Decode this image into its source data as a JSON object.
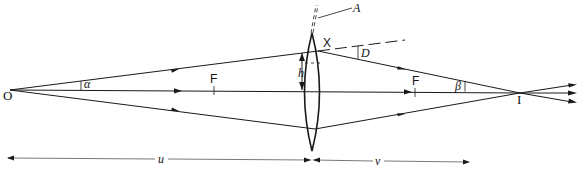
{
  "diagram": {
    "colors": {
      "line": "#1a1a1a",
      "dim_line": "#555555",
      "background": "#ffffff"
    },
    "labels": {
      "object": "O",
      "image": "I",
      "focal_left": "F",
      "focal_right": "F",
      "point_x": "X",
      "apex": "A",
      "deviation": "D",
      "height": "h",
      "angle_alpha": "α",
      "angle_beta": "β",
      "object_distance": "u",
      "image_distance": "v"
    },
    "elements": {
      "optical_axis": {
        "from": [
          10,
          90
        ],
        "to": [
          572,
          93
        ]
      },
      "lens": {
        "center_x": 312,
        "top_y": 33,
        "bottom_y": 151
      },
      "rays": [
        {
          "name": "upper",
          "from": "O",
          "via": "X",
          "to": "I",
          "continues_past_image": true
        },
        {
          "name": "axial",
          "from": "O",
          "to": "I",
          "continues_past_image": true
        },
        {
          "name": "lower",
          "from": "O",
          "via": "lens-bottom",
          "to": "I",
          "continues_past_image": true
        }
      ],
      "dashed_extension": "undeviated continuation of upper ray beyond X",
      "dimensions": [
        {
          "label": "u",
          "from": "O",
          "to": "lens"
        },
        {
          "label": "v",
          "from": "lens",
          "to": "I"
        },
        {
          "label": "h",
          "from": "axis",
          "to": "X"
        }
      ]
    }
  }
}
